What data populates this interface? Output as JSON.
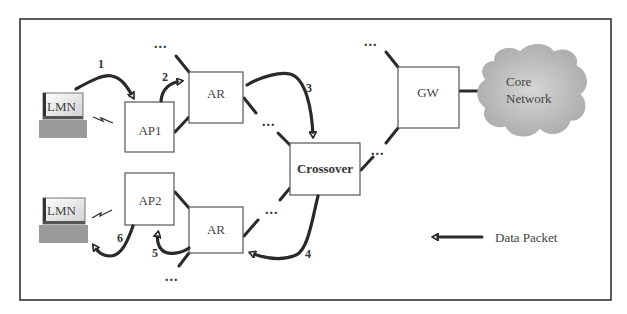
{
  "nodes": {
    "lmn_top": {
      "label": "LMN"
    },
    "lmn_bottom": {
      "label": "LMN"
    },
    "ap1": {
      "label": "AP1"
    },
    "ap2": {
      "label": "AP2"
    },
    "ar_top": {
      "label": "AR"
    },
    "ar_bottom": {
      "label": "AR"
    },
    "crossover": {
      "label": "Crossover"
    },
    "gw": {
      "label": "GW"
    },
    "core": {
      "line1": "Core",
      "line2": "Network"
    }
  },
  "steps": [
    "1",
    "2",
    "3",
    "4",
    "5",
    "6"
  ],
  "ellipsis": "...",
  "legend": {
    "label": "Data Packet"
  },
  "colors": {
    "stroke": "#2a2a2a",
    "box_border": "#555555",
    "cloud": "#b8b8b8",
    "laptop": "#9a9a9a"
  }
}
